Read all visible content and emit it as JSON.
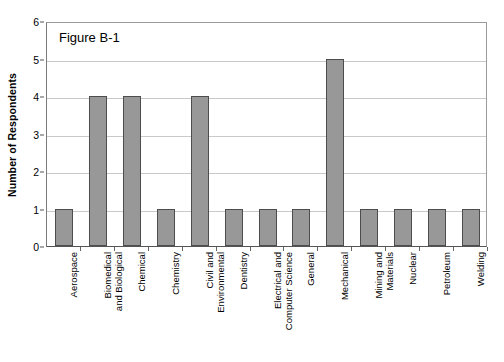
{
  "chart_data": {
    "type": "bar",
    "title": "Figure B-1",
    "xlabel": "",
    "ylabel": "Number of Respondents",
    "ylim": [
      0,
      6
    ],
    "ytick_labels": [
      "6",
      "5",
      "4",
      "3",
      "2",
      "1",
      "0"
    ],
    "yticks": [
      6,
      5,
      4,
      3,
      2,
      1,
      0
    ],
    "grid": true,
    "legend": null,
    "categories": [
      "Aerospace",
      "Biomedical and Biological",
      "Chemical",
      "Chemistry",
      "Civil and Environmental",
      "Dentistry",
      "Electrical and Computer Science",
      "General",
      "Mechanical",
      "Mining and Materials",
      "Nuclear",
      "Petroleum",
      "Welding"
    ],
    "category_label_lines": [
      [
        "Aerospace"
      ],
      [
        "Biomedical",
        "and Biological"
      ],
      [
        "Chemical"
      ],
      [
        "Chemistry"
      ],
      [
        "Civil and",
        "Environmental"
      ],
      [
        "Dentistry"
      ],
      [
        "Electrical and",
        "Computer Science"
      ],
      [
        "General"
      ],
      [
        "Mechanical"
      ],
      [
        "Mining and",
        "Materials"
      ],
      [
        "Nuclear"
      ],
      [
        "Petroleum"
      ],
      [
        "Welding"
      ]
    ],
    "values": [
      1,
      4,
      4,
      1,
      4,
      1,
      1,
      1,
      5,
      1,
      1,
      1,
      1
    ],
    "bar_color": "#989898",
    "bar_border_color": "#4d4d4d",
    "gridline_color": "#c9c9c9",
    "axis_color": "#555555",
    "background_color": "#ffffff"
  }
}
